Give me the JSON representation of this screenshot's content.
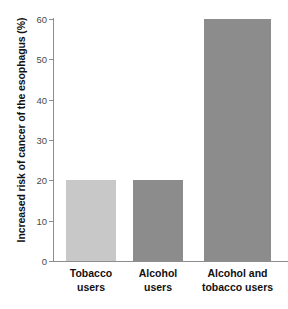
{
  "chart_data": {
    "type": "bar",
    "title": "",
    "xlabel": "",
    "ylabel": "Increased risk of cancer of the esophagus (%)",
    "categories": [
      "Tobacco users",
      "Alcohol users",
      "Alcohol and tobacco users"
    ],
    "category_lines": [
      [
        "Tobacco",
        "users"
      ],
      [
        "Alcohol",
        "users"
      ],
      [
        "Alcohol and",
        "tobacco users"
      ]
    ],
    "values": [
      20,
      20,
      60
    ],
    "ylim": [
      0,
      60
    ],
    "yticks": [
      0,
      10,
      20,
      30,
      40,
      50,
      60
    ],
    "ytick_labels": [
      "0",
      "10",
      "20",
      "30",
      "40",
      "50",
      "60"
    ],
    "grid": false,
    "legend": false,
    "bar_colors": [
      "#c8c8c8",
      "#8c8c8c",
      "#8c8c8c"
    ],
    "axis_color": "#8d8d8d",
    "text_color": "#111111",
    "background": "#ffffff"
  }
}
